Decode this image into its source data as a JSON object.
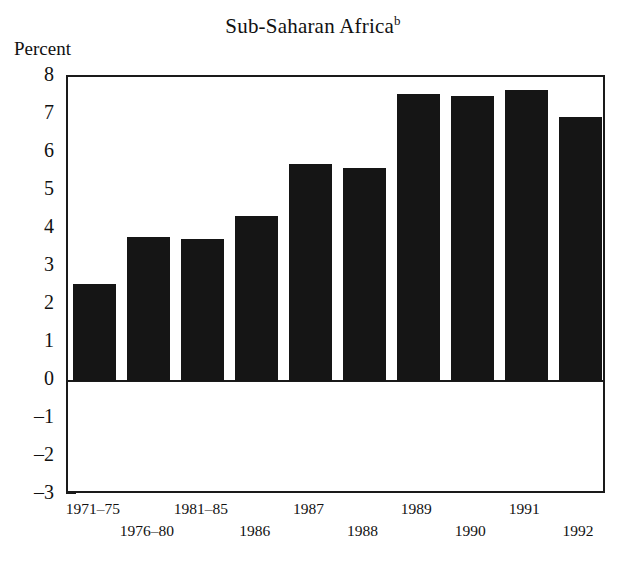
{
  "chart_data": {
    "type": "bar",
    "title": "Sub-Saharan Africa",
    "title_superscript": "b",
    "ylabel": "Percent",
    "xlabel": "",
    "categories": [
      "1971–75",
      "1976–80",
      "1981–85",
      "1986",
      "1987",
      "1988",
      "1989",
      "1990",
      "1991",
      "1992"
    ],
    "values": [
      2.55,
      3.8,
      3.75,
      4.35,
      5.7,
      5.6,
      7.55,
      7.5,
      7.65,
      6.95
    ],
    "ylim": [
      -3,
      8
    ],
    "ytick_labels": [
      "8",
      "7",
      "6",
      "5",
      "4",
      "3",
      "2",
      "1",
      "0",
      "–1",
      "–2",
      "–3"
    ],
    "ytick_values": [
      8,
      7,
      6,
      5,
      4,
      3,
      2,
      1,
      0,
      -1,
      -2,
      -3
    ],
    "grid": false,
    "legend": false,
    "bar_color": "#151515",
    "axis_color": "#1a1a1a",
    "background_color": "#ffffff",
    "label_stagger": [
      "top",
      "bottom",
      "top",
      "bottom",
      "top",
      "bottom",
      "top",
      "bottom",
      "top",
      "bottom"
    ]
  }
}
